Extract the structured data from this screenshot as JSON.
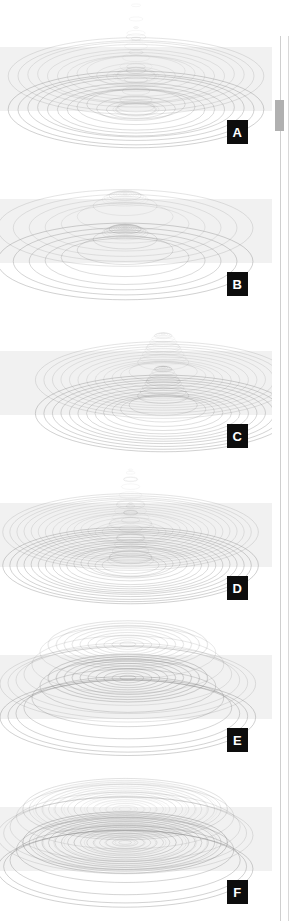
{
  "document": {
    "title": "Mesh Plot Panel Figure",
    "panel_count": 6
  },
  "scrollbar": {
    "name": "vertical-scrollbar",
    "thumb_label": "",
    "position_percent": 11
  },
  "panels": [
    {
      "label": "A",
      "description": "Tall narrow central spike with concentric ripple rings",
      "peak_height": 0.95,
      "peak_width": 0.16,
      "ring_count": 13,
      "center_x": 0.5,
      "plateau": 0.0,
      "ripple": 0.3
    },
    {
      "label": "B",
      "description": "Broad low dome, few wide rings",
      "peak_height": 0.42,
      "peak_width": 0.52,
      "ring_count": 8,
      "center_x": 0.46,
      "plateau": 0.1,
      "ripple": 0.05
    },
    {
      "label": "C",
      "description": "Off-center rounded peak with dense outer rings",
      "peak_height": 0.55,
      "peak_width": 0.3,
      "ring_count": 15,
      "center_x": 0.6,
      "plateau": 0.06,
      "ripple": 0.12
    },
    {
      "label": "D",
      "description": "Narrow central peak with many tight concentric rings",
      "peak_height": 0.72,
      "peak_width": 0.2,
      "ring_count": 18,
      "center_x": 0.48,
      "plateau": 0.02,
      "ripple": 0.18
    },
    {
      "label": "E",
      "description": "Flat-topped plateau, crater-like with banded sides",
      "peak_height": 0.5,
      "peak_width": 0.78,
      "ring_count": 16,
      "center_x": 0.47,
      "plateau": 0.62,
      "ripple": 0.02
    },
    {
      "label": "F",
      "description": "Very flat wide plateau, rings compressed at the edges",
      "peak_height": 0.34,
      "peak_width": 0.92,
      "ring_count": 20,
      "center_x": 0.46,
      "plateau": 0.8,
      "ripple": 0.01
    }
  ],
  "style": {
    "line_color": "#8a8a8a",
    "band_color": "#f1f1f1",
    "badge_bg": "#0d0d0d",
    "badge_fg": "#ffffff",
    "page_bg": "#ffffff",
    "scrollbar_thumb": "#b0b0b0",
    "scrollbar_track": "#cfcfcf"
  },
  "layout": {
    "panel_pitch": 152,
    "panel_width": 272,
    "panel_height": 152,
    "band_top_ratio": 0.31,
    "band_height_ratio": 0.42
  }
}
